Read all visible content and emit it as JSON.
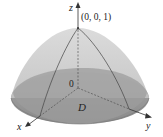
{
  "diagram": {
    "labels": {
      "z_axis": "z",
      "x_axis": "x",
      "y_axis": "y",
      "apex": "(0, 0, 1)",
      "origin": "0",
      "region": "D"
    },
    "colors": {
      "upper_surface": "#cfcfcf",
      "lower_surface": "#9a9a9a",
      "base_region": "#8e8e8e",
      "axis": "#333333",
      "outline": "#555555"
    }
  }
}
